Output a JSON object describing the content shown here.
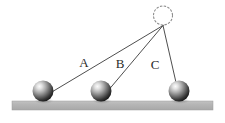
{
  "figure": {
    "width": 225,
    "height": 123,
    "background_color": "#ffffff"
  },
  "pivot": {
    "name": "pivot-point",
    "style": "dotted-circle",
    "cx": 163,
    "cy": 15.5,
    "r": 9.5,
    "stroke_color": "#8c8c8c",
    "fill": "none",
    "dash": "1.6 2.2"
  },
  "attachment": {
    "name": "string-attachment-node",
    "x": 163,
    "y": 25.5
  },
  "strings": [
    {
      "label": "A",
      "name": "string-a",
      "x1": 163,
      "y1": 25.5,
      "x2": 46,
      "y2": 95.5,
      "label_x": 84,
      "label_y": 67,
      "stroke_color": "#3a3a3a",
      "stroke_width": 0.9
    },
    {
      "label": "B",
      "name": "string-b",
      "x1": 163,
      "y1": 25.5,
      "x2": 104,
      "y2": 95.5,
      "label_x": 120,
      "label_y": 68,
      "stroke_color": "#3a3a3a",
      "stroke_width": 0.9
    },
    {
      "label": "C",
      "name": "string-c",
      "x1": 163,
      "y1": 25.5,
      "x2": 179,
      "y2": 95.5,
      "label_x": 155,
      "label_y": 69,
      "stroke_color": "#3a3a3a",
      "stroke_width": 0.9
    }
  ],
  "spheres": [
    {
      "name": "sphere-a",
      "cx": 43,
      "cy": 91,
      "r": 10.5,
      "highlight_color": "#f2f2f2",
      "mid_color": "#9a9a9a",
      "dark_color": "#1d1d1d"
    },
    {
      "name": "sphere-b",
      "cx": 101,
      "cy": 91,
      "r": 10.5,
      "highlight_color": "#f2f2f2",
      "mid_color": "#9a9a9a",
      "dark_color": "#1d1d1d"
    },
    {
      "name": "sphere-c",
      "cx": 179,
      "cy": 91,
      "r": 10.5,
      "highlight_color": "#f2f2f2",
      "mid_color": "#9a9a9a",
      "dark_color": "#1d1d1d"
    }
  ],
  "ground": {
    "name": "ground-surface",
    "x": 12,
    "y": 101,
    "width": 201,
    "height": 9,
    "fill_color": "#b3b3b3",
    "edge_color": "#9d9d9d"
  }
}
